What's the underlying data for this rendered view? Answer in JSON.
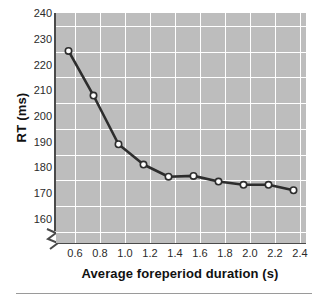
{
  "chart_data": {
    "type": "line",
    "title": "",
    "xlabel": "Average foreperiod duration (s)",
    "ylabel": "RT (ms)",
    "x": [
      0.6,
      0.8,
      1.0,
      1.2,
      1.4,
      1.6,
      1.8,
      2.0,
      2.2,
      2.4
    ],
    "values": [
      228.5,
      212.0,
      194.0,
      186.5,
      182.0,
      182.3,
      180.2,
      179.0,
      179.0,
      177.0
    ],
    "series": [
      {
        "name": "RT",
        "values": [
          228.5,
          212.0,
          194.0,
          186.5,
          182.0,
          182.3,
          180.2,
          179.0,
          179.0,
          177.0
        ]
      }
    ],
    "xlim": [
      0.5,
      2.5
    ],
    "ylim": [
      157.5,
      242.5
    ],
    "xticks": [
      "0.6",
      "0.8",
      "1.0",
      "1.2",
      "1.4",
      "1.6",
      "1.8",
      "2.0",
      "2.2",
      "2.4"
    ],
    "yticks": [
      "240",
      "230",
      "220",
      "210",
      "200",
      "190",
      "180",
      "170",
      "160"
    ],
    "grid": true,
    "legend": "none",
    "axis_break": "y-axis break below 160",
    "marker": "open-circle",
    "colors": {
      "plot_background": "#bdbdbd",
      "gridline": "#ffffff",
      "line": "#2d2d2d",
      "marker_fill": "#ffffff",
      "marker_edge": "#2d2d2d",
      "axis": "#4a4a4a",
      "text": "#111111"
    }
  }
}
